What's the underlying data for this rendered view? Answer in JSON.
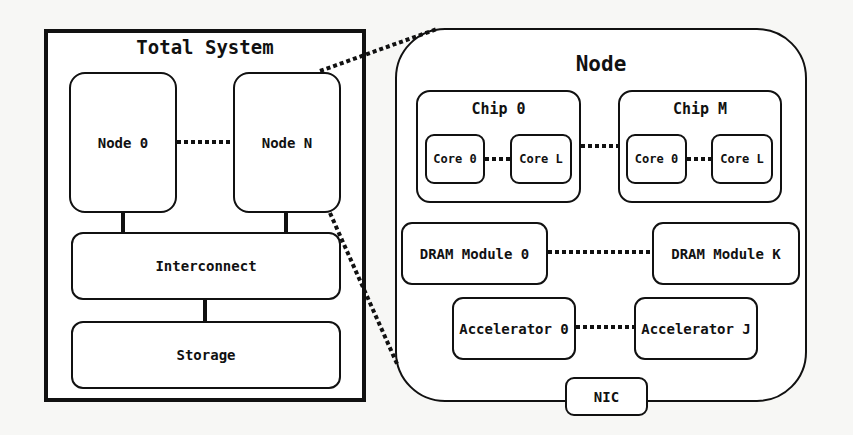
{
  "total_system": {
    "title": "Total System",
    "nodes": [
      {
        "label": "Node 0"
      },
      {
        "label": "Node N"
      }
    ],
    "interconnect": "Interconnect",
    "storage": "Storage"
  },
  "node_detail": {
    "title": "Node",
    "chips": [
      {
        "label": "Chip 0",
        "cores": [
          "Core 0",
          "Core L"
        ]
      },
      {
        "label": "Chip M",
        "cores": [
          "Core 0",
          "Core L"
        ]
      }
    ],
    "dram": [
      "DRAM Module 0",
      "DRAM Module K"
    ],
    "accelerators": [
      "Accelerator 0",
      "Accelerator J"
    ],
    "nic": "NIC"
  },
  "colors": {
    "stroke": "#111111",
    "fill": "#ffffff",
    "background": "#f7f7f5"
  }
}
